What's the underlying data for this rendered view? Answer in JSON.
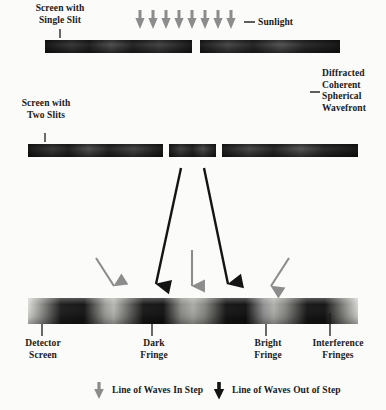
{
  "diagram": {
    "labels": {
      "single_slit_line1": "Screen with",
      "single_slit_line2": "Single Slit",
      "sunlight": "Sunlight",
      "wavefront_line1": "Diffracted",
      "wavefront_line2": "Coherent",
      "wavefront_line3": "Spherical",
      "wavefront_line4": "Wavefront",
      "two_slits_line1": "Screen with",
      "two_slits_line2": "Two Slits",
      "detector_line1": "Detector",
      "detector_line2": "Screen",
      "dark_line1": "Dark",
      "dark_line2": "Fringe",
      "bright_line1": "Bright",
      "bright_line2": "Fringe",
      "interference_line1": "Interference",
      "interference_line2": "Fringes"
    },
    "legend": [
      {
        "key": "in-step",
        "label": "Line of Waves In Step",
        "color": "#8c8c8c"
      },
      {
        "key": "out-step",
        "label": "Line of Waves Out of Step",
        "color": "#1a1a1a"
      }
    ],
    "colors": {
      "background": "#fbfbf9",
      "text": "#1a1a1a",
      "barrier_dark": "#1c1c1c",
      "barrier_mid": "#4a4a4a",
      "wave_dark": "#5a5a5a",
      "wave_light": "#a8a8a8",
      "arrow_in_step": "#8c8c8c",
      "arrow_out_step": "#141414",
      "fringe_dark": "#141414",
      "fringe_bright": "#9a9a9a"
    },
    "sunlight_arrows": {
      "count": 8,
      "x_start": 140,
      "x_spacing": 13,
      "y": 12,
      "color": "#8c8c8c"
    },
    "screens": {
      "single_slit": {
        "y": 40,
        "height": 13,
        "left_start": 45,
        "left_end": 192,
        "right_start": 200,
        "right_end": 340,
        "slit_x": 196
      },
      "two_slits": {
        "y": 144,
        "height": 13,
        "seg1_start": 28,
        "seg1_end": 163,
        "seg2_start": 169,
        "seg2_end": 216,
        "seg3_start": 222,
        "seg3_end": 358,
        "slit1_x": 166,
        "slit2_x": 219
      },
      "detector": {
        "y": 298,
        "height": 26,
        "x_start": 28,
        "x_end": 358
      }
    },
    "fringe_ticks": [
      {
        "name": "detector-screen-tick",
        "x": 42
      },
      {
        "name": "dark-fringe-tick",
        "x": 152
      },
      {
        "name": "bright-fringe-tick",
        "x": 266
      },
      {
        "name": "interference-fringes-tick",
        "x": 330
      }
    ],
    "result_arrows": [
      {
        "type": "in-step",
        "x": 116,
        "color": "#8c8c8c"
      },
      {
        "type": "out-step",
        "x": 157,
        "color": "#141414"
      },
      {
        "type": "in-step",
        "x": 192,
        "color": "#8c8c8c"
      },
      {
        "type": "out-step",
        "x": 228,
        "color": "#141414"
      },
      {
        "type": "in-step",
        "x": 269,
        "color": "#8c8c8c"
      }
    ],
    "leader_lines": {
      "sunlight": {
        "x1": 244,
        "y1": 22,
        "x2": 254,
        "y2": 22
      },
      "wavefront": {
        "x1": 310,
        "y1": 92,
        "x2": 319,
        "y2": 92
      },
      "single_slit_tick": {
        "x": 60,
        "y1": 28,
        "y2": 38
      },
      "two_slits_tick": {
        "x": 45,
        "y1": 132,
        "y2": 142
      }
    }
  }
}
